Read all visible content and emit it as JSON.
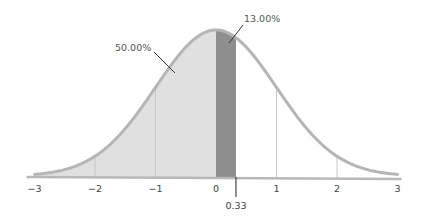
{
  "chart_data": {
    "type": "area",
    "title": "",
    "xlabel": "",
    "ylabel": "",
    "distribution": "standard normal",
    "mean": 0,
    "sd": 1,
    "xlim": [
      -3,
      3
    ],
    "x_ticks": [
      -3,
      -2,
      -1,
      0,
      1,
      2,
      3
    ],
    "x_tick_labels": [
      "−3",
      "−2",
      "−1",
      "0",
      "1",
      "2",
      "3"
    ],
    "gridlines_at": [
      -2,
      -1,
      1,
      2
    ],
    "shaded_regions": [
      {
        "name": "left-region",
        "from": -3,
        "to": 0,
        "percent_label": "50.00%",
        "color": "#e0e0e0"
      },
      {
        "name": "band-region",
        "from": 0,
        "to": 0.33,
        "percent_label": "13.00%",
        "color": "#8e8e8e"
      }
    ],
    "marker": {
      "value": 0.33,
      "label": "0.33"
    },
    "colors": {
      "curve": "#b5b5b5",
      "axis": "#b8b8b8",
      "gridline": "#c8c8c8",
      "leader": "#333333",
      "marker": "#222222"
    }
  }
}
